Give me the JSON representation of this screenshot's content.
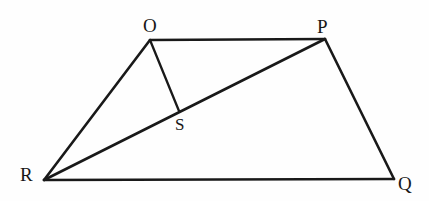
{
  "figure": {
    "kind": "geometry-diagram",
    "canvas": {
      "width": 429,
      "height": 201
    },
    "background_color": "#fefefe",
    "stroke_color": "#191919",
    "label_color": "#171717",
    "points": [
      {
        "id": "O",
        "label": "O",
        "x": 150,
        "y": 40,
        "label_x": 143,
        "label_y": 16,
        "size": "normal"
      },
      {
        "id": "P",
        "label": "P",
        "x": 325,
        "y": 39,
        "label_x": 317,
        "label_y": 17,
        "size": "normal"
      },
      {
        "id": "Q",
        "label": "Q",
        "x": 394,
        "y": 179,
        "label_x": 398,
        "label_y": 174,
        "size": "normal"
      },
      {
        "id": "R",
        "label": "R",
        "x": 44,
        "y": 180,
        "label_x": 20,
        "label_y": 165,
        "size": "normal"
      },
      {
        "id": "S",
        "label": "S",
        "x": 179,
        "y": 111,
        "label_x": 175,
        "label_y": 116,
        "size": "small"
      }
    ],
    "segments": [
      {
        "id": "OP",
        "from": "O",
        "to": "P",
        "weight": "thick"
      },
      {
        "id": "PQ",
        "from": "P",
        "to": "Q",
        "weight": "thick"
      },
      {
        "id": "QR",
        "from": "Q",
        "to": "R",
        "weight": "thick"
      },
      {
        "id": "RO",
        "from": "R",
        "to": "O",
        "weight": "thick"
      },
      {
        "id": "RP",
        "from": "R",
        "to": "P",
        "weight": "thick"
      },
      {
        "id": "OS",
        "from": "O",
        "to": "S",
        "weight": "thin"
      }
    ]
  }
}
